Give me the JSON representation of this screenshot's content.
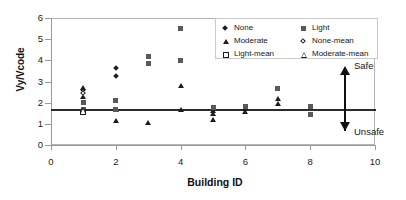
{
  "chart_data": {
    "type": "scatter",
    "title": "",
    "xlabel": "Building ID",
    "ylabel": "Vy/Vcode",
    "xlim": [
      0,
      10
    ],
    "ylim": [
      0,
      6
    ],
    "xticks": [
      "0",
      "2",
      "4",
      "6",
      "8",
      "10"
    ],
    "yticks": [
      "0",
      "1",
      "2",
      "3",
      "4",
      "5",
      "6"
    ],
    "grid": false,
    "legend_position": "top-right",
    "threshold": {
      "value": 1.65,
      "label_above": "Safe",
      "label_below": "Unsafe",
      "color": "#2b2b2b"
    },
    "series": [
      {
        "name": "None",
        "marker": "filled-diamond",
        "color": "#1c1c1c",
        "points": [
          {
            "x": 1,
            "y": 2.62
          },
          {
            "x": 2,
            "y": 3.65
          },
          {
            "x": 2,
            "y": 3.25
          }
        ]
      },
      {
        "name": "Moderate",
        "marker": "filled-triangle",
        "color": "#1c1c1c",
        "points": [
          {
            "x": 1,
            "y": 2.7
          },
          {
            "x": 1,
            "y": 2.3
          },
          {
            "x": 1,
            "y": 1.62
          },
          {
            "x": 2,
            "y": 1.66
          },
          {
            "x": 2,
            "y": 1.15
          },
          {
            "x": 3,
            "y": 1.05
          },
          {
            "x": 4,
            "y": 2.8
          },
          {
            "x": 4,
            "y": 1.68
          },
          {
            "x": 5,
            "y": 1.62
          },
          {
            "x": 5,
            "y": 1.48
          },
          {
            "x": 5,
            "y": 1.18
          },
          {
            "x": 6,
            "y": 1.7
          },
          {
            "x": 6,
            "y": 1.55
          },
          {
            "x": 7,
            "y": 2.2
          },
          {
            "x": 7,
            "y": 1.95
          }
        ]
      },
      {
        "name": "Light",
        "marker": "filled-square",
        "color": "#595959",
        "points": [
          {
            "x": 1,
            "y": 2.02
          },
          {
            "x": 1,
            "y": 1.7
          },
          {
            "x": 2,
            "y": 2.1
          },
          {
            "x": 2,
            "y": 1.68
          },
          {
            "x": 3,
            "y": 4.2
          },
          {
            "x": 3,
            "y": 3.85
          },
          {
            "x": 4,
            "y": 5.5
          },
          {
            "x": 4,
            "y": 4.0
          },
          {
            "x": 5,
            "y": 1.78
          },
          {
            "x": 6,
            "y": 1.8
          },
          {
            "x": 7,
            "y": 2.68
          },
          {
            "x": 8,
            "y": 1.8
          },
          {
            "x": 8,
            "y": 1.42
          }
        ]
      },
      {
        "name": "None-mean",
        "marker": "open-diamond",
        "color": "#1c1c1c",
        "points": [
          {
            "x": 1,
            "y": 2.48
          }
        ]
      },
      {
        "name": "Light-mean",
        "marker": "open-square",
        "color": "#1c1c1c",
        "points": [
          {
            "x": 1,
            "y": 1.55
          }
        ]
      },
      {
        "name": "Moderate-mean",
        "marker": "open-triangle",
        "color": "#1c1c1c",
        "points": [
          {
            "x": 1,
            "y": 1.66
          }
        ]
      }
    ],
    "legend": [
      {
        "label": "None",
        "marker": "filled-diamond"
      },
      {
        "label": "Light",
        "marker": "filled-square"
      },
      {
        "label": "Moderate",
        "marker": "filled-triangle"
      },
      {
        "label": "None-mean",
        "marker": "open-diamond"
      },
      {
        "label": "Light-mean",
        "marker": "open-square"
      },
      {
        "label": "Moderate-mean",
        "marker": "open-triangle"
      }
    ]
  },
  "axes": {
    "y_title": "Vy/Vcode",
    "x_title": "Building ID",
    "y_tick_labels": [
      "6",
      "5",
      "4",
      "3",
      "2",
      "1",
      "0"
    ],
    "x_tick_labels": [
      "0",
      "2",
      "4",
      "6",
      "8",
      "10"
    ]
  },
  "annotations": {
    "safe": "Safe",
    "unsafe": "Unsafe"
  }
}
